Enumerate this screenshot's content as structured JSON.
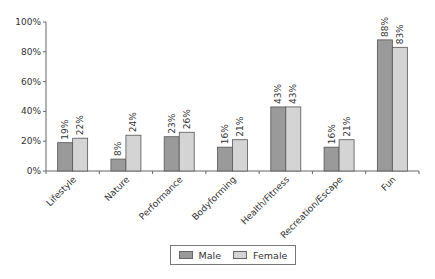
{
  "chart_data": {
    "type": "bar",
    "title": "",
    "xlabel": "",
    "ylabel": "",
    "ylim": [
      0,
      100
    ],
    "yticks": [
      "0%",
      "20%",
      "40%",
      "60%",
      "80%",
      "100%"
    ],
    "grid": false,
    "legend_position": "bottom",
    "categories": [
      "Lifestyle",
      "Nature",
      "Performance",
      "Bodyforming",
      "Health/Fitness",
      "Recreation/Escape",
      "Fun"
    ],
    "series": [
      {
        "name": "Male",
        "color": "#9a9a9a",
        "values": [
          19,
          8,
          23,
          16,
          43,
          16,
          88
        ],
        "labels": [
          "19%",
          "8%",
          "23%",
          "16%",
          "43%",
          "16%",
          "88%"
        ]
      },
      {
        "name": "Female",
        "color": "#d4d4d4",
        "values": [
          22,
          24,
          26,
          21,
          43,
          21,
          83
        ],
        "labels": [
          "22%",
          "24%",
          "26%",
          "21%",
          "43%",
          "21%",
          "83%"
        ]
      }
    ]
  },
  "legend": {
    "male_label": "Male",
    "female_label": "Female"
  }
}
